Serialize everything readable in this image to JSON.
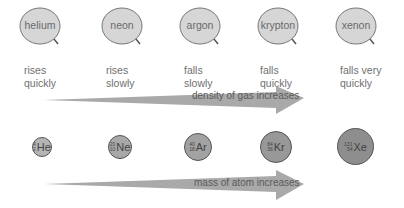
{
  "gases": [
    {
      "name": "helium",
      "behavior_line1": "rises",
      "behavior_line2": "quickly",
      "symbol": "He",
      "mass_number": "4",
      "atomic_number": "2",
      "atom_color": "#b4b4b4"
    },
    {
      "name": "neon",
      "behavior_line1": "rises",
      "behavior_line2": "slowly",
      "symbol": "Ne",
      "mass_number": "20",
      "atomic_number": "10",
      "atom_color": "#a8a8a8"
    },
    {
      "name": "argon",
      "behavior_line1": "falls",
      "behavior_line2": "slowly",
      "symbol": "Ar",
      "mass_number": "40",
      "atomic_number": "18",
      "atom_color": "#a2a2a2"
    },
    {
      "name": "krypton",
      "behavior_line1": "falls",
      "behavior_line2": "quickly",
      "symbol": "Kr",
      "mass_number": "84",
      "atomic_number": "36",
      "atom_color": "#989898"
    },
    {
      "name": "xenon",
      "behavior_line1": "falls very",
      "behavior_line2": "quickly",
      "symbol": "Xe",
      "mass_number": "131",
      "atomic_number": "54",
      "atom_color": "#8e8e8e"
    }
  ],
  "arrows": {
    "density": "density of gas increases",
    "mass": "mass of atom increases"
  },
  "colors": {
    "balloon_fill": "#d6d6d6",
    "balloon_stroke": "#777777",
    "arrow_fill": "#a9a9a9"
  }
}
